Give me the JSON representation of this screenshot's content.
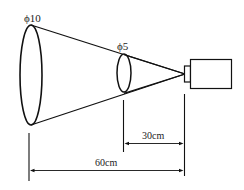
{
  "diagram": {
    "labels": {
      "large_diameter": "ϕ10",
      "small_diameter": "ϕ5",
      "near_distance": "30cm",
      "far_distance": "60cm"
    },
    "colors": {
      "stroke": "#111111",
      "background": "#ffffff"
    }
  }
}
